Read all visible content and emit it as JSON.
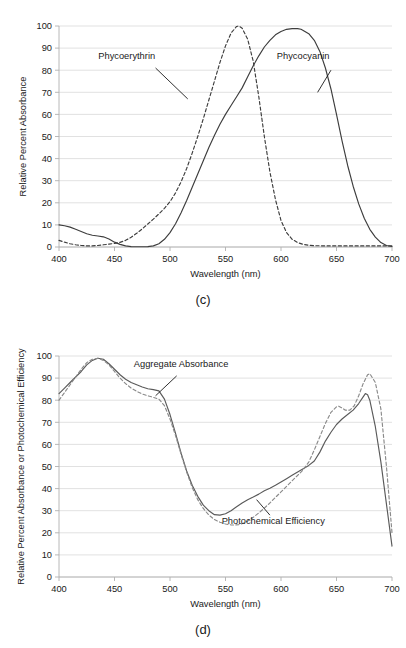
{
  "figure": {
    "panels": [
      {
        "id": "c",
        "caption": "(c)",
        "chart_data": {
          "type": "line",
          "title": "",
          "xlabel": "Wavelength (nm)",
          "ylabel": "Relative Percent Absorbance",
          "xlim": [
            400,
            700
          ],
          "ylim": [
            0,
            100
          ],
          "xticks": [
            400,
            450,
            500,
            550,
            600,
            650,
            700
          ],
          "yticks": [
            0,
            10,
            20,
            30,
            40,
            50,
            60,
            70,
            80,
            90,
            100
          ],
          "grid": true,
          "legend_position": "inline-annotations",
          "series": [
            {
              "name": "Phycoerythrin",
              "style": "dashed",
              "color": "#3d3d3d",
              "x": [
                400,
                405,
                410,
                415,
                420,
                425,
                430,
                435,
                440,
                445,
                450,
                455,
                460,
                465,
                470,
                475,
                480,
                485,
                490,
                495,
                500,
                505,
                510,
                515,
                520,
                525,
                530,
                535,
                540,
                545,
                550,
                555,
                560,
                562,
                565,
                570,
                575,
                580,
                585,
                590,
                595,
                600,
                605,
                610,
                615,
                620,
                625,
                630,
                640,
                650,
                660,
                670,
                680,
                690,
                700
              ],
              "y": [
                3,
                2.2,
                1.5,
                1.0,
                0.7,
                0.5,
                0.5,
                0.7,
                1.0,
                1.3,
                1.6,
                2.1,
                3.0,
                4.4,
                6.2,
                8.2,
                10.4,
                12.6,
                15.0,
                17.5,
                20.5,
                24.5,
                29.5,
                35.5,
                42.5,
                50.0,
                58.0,
                66.5,
                75.0,
                83.5,
                91.0,
                96.8,
                99.8,
                100,
                99.0,
                94.0,
                84.0,
                68.0,
                50.0,
                34.0,
                21.5,
                12.0,
                6.5,
                3.5,
                2.0,
                1.2,
                0.8,
                0.6,
                0.5,
                0.5,
                0.5,
                0.5,
                0.5,
                0.5,
                0.5
              ]
            },
            {
              "name": "Phycocyanin",
              "style": "solid",
              "color": "#3d3d3d",
              "x": [
                400,
                405,
                410,
                415,
                420,
                425,
                430,
                435,
                440,
                445,
                450,
                455,
                460,
                465,
                470,
                475,
                480,
                485,
                490,
                495,
                500,
                505,
                510,
                515,
                520,
                525,
                530,
                535,
                540,
                545,
                550,
                555,
                560,
                565,
                570,
                575,
                580,
                585,
                590,
                595,
                600,
                605,
                610,
                615,
                618,
                620,
                625,
                630,
                635,
                640,
                645,
                650,
                655,
                660,
                665,
                670,
                675,
                680,
                685,
                690,
                695,
                700
              ],
              "y": [
                10,
                9.6,
                9.0,
                8.0,
                7.0,
                6.0,
                5.3,
                5.0,
                4.6,
                3.6,
                2.2,
                1.2,
                0.5,
                0.2,
                0.1,
                0.1,
                0.2,
                0.5,
                1.5,
                3.5,
                6.5,
                10.5,
                15.5,
                21.0,
                27.0,
                33.0,
                39.0,
                45.0,
                50.5,
                55.5,
                60.0,
                64.0,
                68.0,
                72.0,
                77.0,
                82.0,
                86.5,
                90.5,
                93.5,
                96.0,
                97.5,
                98.5,
                98.8,
                98.8,
                98.5,
                98.0,
                96.5,
                93.5,
                88.5,
                81.0,
                71.5,
                60.0,
                48.0,
                37.0,
                27.5,
                19.5,
                13.0,
                8.0,
                4.5,
                2.0,
                0.7,
                0.2
              ]
            }
          ],
          "annotations": [
            {
              "text": "Phycoerythrin",
              "label_x": 461,
              "label_y": 85,
              "leader_from_x": 487,
              "leader_from_y": 81,
              "leader_to_x": 516,
              "leader_to_y": 67
            },
            {
              "text": "Phycocyanin",
              "label_x": 620,
              "label_y": 85,
              "leader_from_x": 645,
              "leader_from_y": 80,
              "leader_to_x": 633,
              "leader_to_y": 70
            }
          ]
        }
      },
      {
        "id": "d",
        "caption": "(d)",
        "chart_data": {
          "type": "line",
          "title": "",
          "xlabel": "Wavelength (nm)",
          "ylabel": "Relative Percent Absorbance or Photochemical Efficiency",
          "xlim": [
            400,
            700
          ],
          "ylim": [
            0,
            100
          ],
          "xticks": [
            400,
            450,
            500,
            550,
            600,
            650,
            700
          ],
          "yticks": [
            0,
            10,
            20,
            30,
            40,
            50,
            60,
            70,
            80,
            90,
            100
          ],
          "grid": true,
          "legend_position": "inline-annotations",
          "series": [
            {
              "name": "Aggregate Absorbance",
              "style": "solid",
              "color": "#5a5a5a",
              "x": [
                400,
                405,
                410,
                415,
                420,
                425,
                430,
                435,
                440,
                445,
                450,
                455,
                460,
                465,
                470,
                475,
                480,
                485,
                490,
                495,
                500,
                505,
                510,
                515,
                520,
                525,
                530,
                535,
                540,
                545,
                550,
                555,
                560,
                565,
                570,
                575,
                580,
                585,
                590,
                595,
                600,
                605,
                610,
                615,
                620,
                625,
                630,
                635,
                640,
                645,
                650,
                655,
                660,
                665,
                670,
                674,
                676,
                678,
                680,
                685,
                690,
                695,
                700
              ],
              "y": [
                83,
                85.5,
                88,
                90.5,
                93,
                96,
                98,
                99,
                98.5,
                96.5,
                94,
                91.5,
                89.5,
                88,
                87,
                86,
                85.2,
                84.8,
                84.2,
                80.5,
                73.5,
                65.0,
                56.0,
                48.0,
                41.5,
                36.5,
                32.5,
                30.0,
                28.2,
                28.0,
                28.6,
                30.0,
                31.8,
                33.5,
                35.0,
                36.2,
                37.5,
                39.0,
                40.2,
                41.5,
                43.0,
                44.5,
                46.0,
                47.5,
                49.0,
                50.5,
                52.5,
                56.5,
                61.5,
                65.5,
                69.0,
                71.5,
                73.5,
                75.5,
                78.5,
                81.5,
                83.0,
                82.5,
                80.0,
                68.0,
                52.0,
                33.0,
                14.0
              ]
            },
            {
              "name": "Photochemical Efficiency",
              "style": "dashed",
              "color": "#8a8a8a",
              "x": [
                400,
                405,
                410,
                415,
                420,
                425,
                430,
                435,
                440,
                445,
                450,
                455,
                460,
                465,
                470,
                475,
                480,
                485,
                490,
                495,
                500,
                505,
                510,
                515,
                520,
                525,
                530,
                535,
                540,
                545,
                550,
                555,
                558,
                562,
                566,
                570,
                575,
                580,
                585,
                590,
                595,
                600,
                605,
                610,
                615,
                620,
                625,
                630,
                635,
                640,
                645,
                650,
                652,
                655,
                658,
                662,
                666,
                670,
                674,
                678,
                680,
                685,
                690,
                695,
                700
              ],
              "y": [
                80,
                83.5,
                87,
                90.5,
                94,
                97,
                98.5,
                99,
                98,
                96,
                93,
                90,
                87.5,
                85.5,
                84,
                82.8,
                82.0,
                81.3,
                80.5,
                77.5,
                71.5,
                64.0,
                55.5,
                47.5,
                40.5,
                35.0,
                31.0,
                28.0,
                26.0,
                24.8,
                24.0,
                23.6,
                23.5,
                23.7,
                24.3,
                25.3,
                27.0,
                29.0,
                31.2,
                33.5,
                36.0,
                38.5,
                41.0,
                43.5,
                46.0,
                48.5,
                52.0,
                57.5,
                63.5,
                69.5,
                74.5,
                77.0,
                77.3,
                76.5,
                75.5,
                75.5,
                77.5,
                82.0,
                87.5,
                91.5,
                92.0,
                88.0,
                76.0,
                50.0,
                20.0
              ]
            }
          ],
          "annotations": [
            {
              "text": "Aggregate Absorbance",
              "label_x": 510,
              "label_y": 95,
              "leader_from_x": 506,
              "leader_from_y": 91,
              "leader_to_x": 487,
              "leader_to_y": 82
            },
            {
              "text": "Photochemical Efficiency",
              "label_x": 593,
              "label_y": 24,
              "leader_from_x": 590,
              "leader_from_y": 28,
              "leader_to_x": 578,
              "leader_to_y": 35
            }
          ]
        }
      }
    ]
  },
  "style": {
    "grid_color": "#d9d9d9",
    "axis_color": "#b0b0b0",
    "text_color": "#1a1a1a",
    "background": "#ffffff"
  }
}
